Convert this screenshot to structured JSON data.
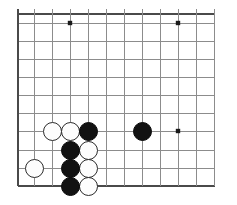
{
  "board": {
    "kind": "go-board-diagram",
    "title": "Go board corner position",
    "size_px": {
      "width": 237,
      "height": 205
    },
    "board_size": 19,
    "visible_columns": 12,
    "visible_rows": 11,
    "origin_px": {
      "x": 18,
      "y": 14
    },
    "spacing_px": 18,
    "edges": {
      "left_edge_visible": true,
      "top_edge_visible": true,
      "bottom_edge_visible": true,
      "right_edge_visible": false
    },
    "colors": {
      "background": "#ffffff",
      "grid_line": "#8c8c8c",
      "edge_line": "#4a4a4a",
      "black_stone": "#121212",
      "white_stone": "#fdfdfd",
      "white_stone_border": "#2b2b2b",
      "star_point": "#1a1a1a"
    },
    "line_widths": {
      "grid": 1,
      "edge": 1.8
    },
    "column_x": [
      18,
      34,
      52,
      70,
      88,
      106,
      124,
      142,
      160,
      178,
      196,
      214
    ],
    "row_y": [
      14,
      23,
      41,
      59,
      77,
      95,
      113,
      131,
      150,
      168,
      186
    ],
    "star_points": [
      {
        "x": 70,
        "y": 23,
        "label": "upper-left-star"
      },
      {
        "x": 178,
        "y": 23,
        "label": "upper-right-star"
      },
      {
        "x": 178,
        "y": 131,
        "label": "lower-right-star"
      }
    ],
    "star_radius_px": 2.2,
    "stone_radius_px": 9.5,
    "stones": [
      {
        "color": "white",
        "x": 52,
        "y": 131,
        "name": "white-stone-1"
      },
      {
        "color": "white",
        "x": 70,
        "y": 131,
        "name": "white-stone-2"
      },
      {
        "color": "black",
        "x": 88,
        "y": 131,
        "name": "black-stone-1"
      },
      {
        "color": "black",
        "x": 142,
        "y": 131,
        "name": "black-stone-2"
      },
      {
        "color": "black",
        "x": 70,
        "y": 150,
        "name": "black-stone-3"
      },
      {
        "color": "white",
        "x": 88,
        "y": 150,
        "name": "white-stone-3"
      },
      {
        "color": "white",
        "x": 34,
        "y": 168,
        "name": "white-stone-4"
      },
      {
        "color": "black",
        "x": 70,
        "y": 168,
        "name": "black-stone-4"
      },
      {
        "color": "white",
        "x": 88,
        "y": 168,
        "name": "white-stone-5"
      },
      {
        "color": "black",
        "x": 70,
        "y": 186,
        "name": "black-stone-5"
      },
      {
        "color": "white",
        "x": 88,
        "y": 186,
        "name": "white-stone-6"
      }
    ],
    "counts": {
      "black_stones": 5,
      "white_stones": 6,
      "total_stones": 11
    }
  }
}
